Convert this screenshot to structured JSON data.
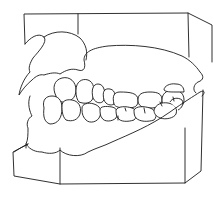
{
  "figure": {
    "style": "black line drawing on white",
    "colors": {
      "background": "#ffffff",
      "stroke": "#1a1a1a"
    }
  }
}
